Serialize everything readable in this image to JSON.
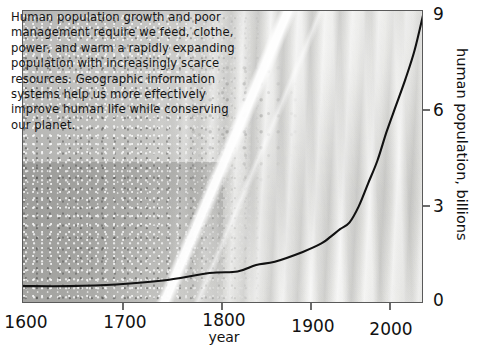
{
  "figure": {
    "caption": "Human population growth and poor\nmanagement require we feed, clothe,\npower, and warm a rapidly expanding\npopulation with increasingly scarce\nresources.  Geographic information\nsystems help us more effectively\nimprove human life while conserving\nour planet.",
    "background_image_name": "aerial-satellite-photo-urban-and-dunes"
  },
  "chart_data": {
    "type": "line",
    "title": "",
    "xlabel": "year",
    "ylabel": "human population, billions",
    "xlim": [
      1600,
      2030
    ],
    "ylim": [
      0,
      9
    ],
    "xticks": [
      1600,
      1700,
      1800,
      1900,
      2000
    ],
    "xtick_labels": [
      "1600",
      "1700",
      "1800",
      "1900",
      "2000"
    ],
    "yticks": [
      0,
      3,
      6,
      9
    ],
    "ytick_labels": [
      "0",
      "3",
      "6",
      "9"
    ],
    "y_axis_side": "right",
    "grid": false,
    "legend": false,
    "series": [
      {
        "name": "human population",
        "color": "#111111",
        "x": [
          1600,
          1650,
          1700,
          1750,
          1800,
          1830,
          1850,
          1870,
          1900,
          1920,
          1930,
          1940,
          1950,
          1960,
          1970,
          1980,
          1990,
          2000,
          2010,
          2020,
          2030
        ],
        "values": [
          0.55,
          0.55,
          0.6,
          0.72,
          0.95,
          1.0,
          1.2,
          1.3,
          1.6,
          1.86,
          2.07,
          2.3,
          2.5,
          3.0,
          3.7,
          4.4,
          5.3,
          6.1,
          6.9,
          7.8,
          9.0
        ]
      }
    ]
  },
  "axis_labels": {
    "x_ticks": [
      {
        "label": "1600",
        "x": 22
      },
      {
        "label": "1700",
        "x": 123
      },
      {
        "label": "1800",
        "x": 222
      },
      {
        "label": "1900",
        "x": 311
      },
      {
        "label": "2000",
        "x": 390
      }
    ],
    "y_ticks": [
      {
        "label": "9",
        "y": 12
      },
      {
        "label": "6",
        "y": 110
      },
      {
        "label": "3",
        "y": 206
      },
      {
        "label": "0",
        "y": 302
      }
    ]
  }
}
